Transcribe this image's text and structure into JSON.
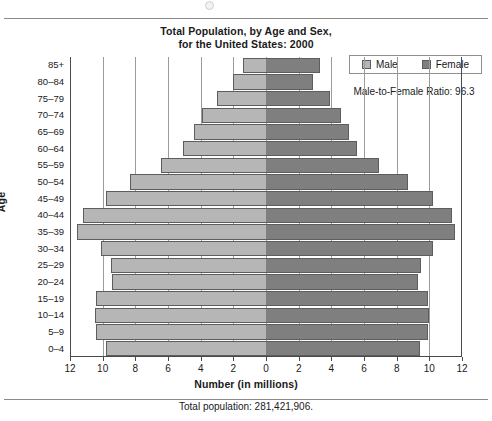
{
  "chart_data": {
    "type": "bar",
    "subtype": "population-pyramid",
    "title": "Total Population, by Age and Sex, for the United States: 2000",
    "title_line1": "Total Population, by Age and Sex,",
    "title_line2": "for the United States: 2000",
    "xlabel": "Number (in millions)",
    "ylabel": "Age",
    "caption": "Total population: 281,421,906.",
    "annotation": "Male-to-Female Ratio: 96.3",
    "grid": true,
    "legend_position": "top-right",
    "xlim": [
      -12,
      12
    ],
    "xticks": [
      12,
      10,
      8,
      6,
      4,
      2,
      0,
      2,
      4,
      6,
      8,
      10,
      12
    ],
    "xtick_values": [
      -12,
      -10,
      -8,
      -6,
      -4,
      -2,
      0,
      2,
      4,
      6,
      8,
      10,
      12
    ],
    "categories": [
      "85+",
      "80–84",
      "75–79",
      "70–74",
      "65–69",
      "60–64",
      "55–59",
      "50–54",
      "45–49",
      "40–44",
      "35–39",
      "30–34",
      "25–29",
      "20–24",
      "15–19",
      "10–14",
      "5–9",
      "0–4"
    ],
    "series": [
      {
        "name": "Male",
        "color": "#b6b6b6",
        "values": [
          1.4,
          2.0,
          3.0,
          3.9,
          4.4,
          5.1,
          6.4,
          8.3,
          9.8,
          11.2,
          11.6,
          10.1,
          9.5,
          9.4,
          10.4,
          10.5,
          10.4,
          9.8
        ]
      },
      {
        "name": "Female",
        "color": "#7f7f7f",
        "values": [
          3.3,
          2.9,
          3.9,
          4.6,
          5.1,
          5.6,
          6.9,
          8.7,
          10.2,
          11.4,
          11.6,
          10.2,
          9.5,
          9.3,
          9.9,
          10.0,
          9.9,
          9.4
        ]
      }
    ]
  },
  "legend": {
    "male_label": "Male",
    "female_label": "Female"
  },
  "colors": {
    "male": "#b6b6b6",
    "female": "#7f7f7f",
    "axis": "#4a4a4a",
    "grid": "#9c9c9c",
    "background": "#ffffff"
  }
}
